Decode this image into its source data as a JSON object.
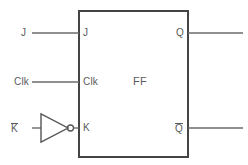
{
  "diagram": {
    "type": "logic-schematic",
    "canvas": {
      "width": 248,
      "height": 165
    },
    "colors": {
      "background": "#ffffff",
      "wire": "#666666",
      "block_border": "#444444",
      "text": "#5a5a5a"
    },
    "block": {
      "label": "FF",
      "x": 78,
      "y": 10,
      "width": 110,
      "height": 147,
      "border_width": 2
    },
    "inputs": [
      {
        "name": "j",
        "external_label": "J",
        "pin_label": "J",
        "y": 33,
        "wire_from_x": 32,
        "wire_to_x": 78
      },
      {
        "name": "clk",
        "external_label": "Clk",
        "pin_label": "Clk",
        "y": 82,
        "wire_from_x": 32,
        "wire_to_x": 78
      },
      {
        "name": "kbar",
        "external_label": "K",
        "external_overbar": true,
        "pin_label": "K",
        "y": 128,
        "wire_from_x": 32,
        "wire_to_x": 78
      }
    ],
    "outputs": [
      {
        "name": "q",
        "pin_label": "Q",
        "overbar": false,
        "y": 33,
        "wire_from_x": 188,
        "wire_to_x": 243
      },
      {
        "name": "qbar",
        "pin_label": "Q",
        "overbar": true,
        "y": 128,
        "wire_from_x": 188,
        "wire_to_x": 243
      }
    ],
    "gates": [
      {
        "name": "inverter",
        "type": "NOT",
        "apex_x": 68,
        "base_x": 40,
        "center_y": 128,
        "half_height": 14,
        "bubble_cx": 70,
        "bubble_cy": 128,
        "bubble_r": 3
      }
    ]
  }
}
